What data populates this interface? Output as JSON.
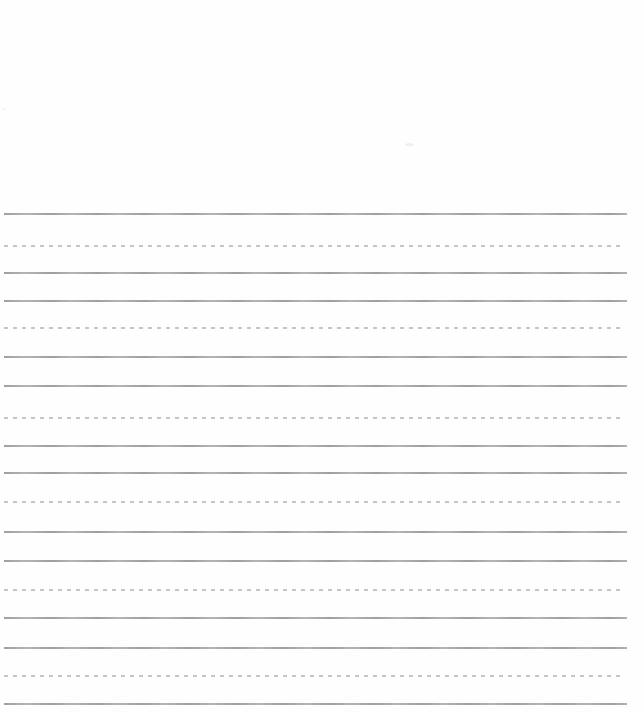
{
  "page": {
    "kind": "blank ruled handwriting practice paper (scanned sheet)",
    "background_color": "#fefefe",
    "width_px": 644,
    "height_px": 714,
    "blank_top_area_px": 210
  },
  "ruling": {
    "left_x": 4,
    "right_x": 627,
    "line_thickness_px": 2,
    "solid_color_dark": "#96969a",
    "solid_color_light": "#aeaeb0",
    "dashed_color": "#babcba",
    "dash_length_px": 4,
    "dash_gap_px": 5,
    "group_pattern": [
      "solid",
      "dashed",
      "solid"
    ],
    "lines": [
      {
        "y": 213,
        "style": "solid"
      },
      {
        "y": 245,
        "style": "dashed"
      },
      {
        "y": 272,
        "style": "solid"
      },
      {
        "y": 300,
        "style": "solid"
      },
      {
        "y": 327,
        "style": "dashed"
      },
      {
        "y": 356,
        "style": "solid"
      },
      {
        "y": 385,
        "style": "solid"
      },
      {
        "y": 417,
        "style": "dashed"
      },
      {
        "y": 445,
        "style": "solid"
      },
      {
        "y": 472,
        "style": "solid"
      },
      {
        "y": 501,
        "style": "dashed"
      },
      {
        "y": 531,
        "style": "solid"
      },
      {
        "y": 560,
        "style": "solid"
      },
      {
        "y": 589,
        "style": "dashed"
      },
      {
        "y": 617,
        "style": "solid"
      },
      {
        "y": 647,
        "style": "solid"
      },
      {
        "y": 675,
        "style": "dashed"
      },
      {
        "y": 703,
        "style": "solid"
      }
    ]
  },
  "artifacts": [
    {
      "x": 405,
      "y": 143,
      "w": 9,
      "h": 3
    },
    {
      "x": 2,
      "y": 108,
      "w": 3,
      "h": 2
    }
  ]
}
